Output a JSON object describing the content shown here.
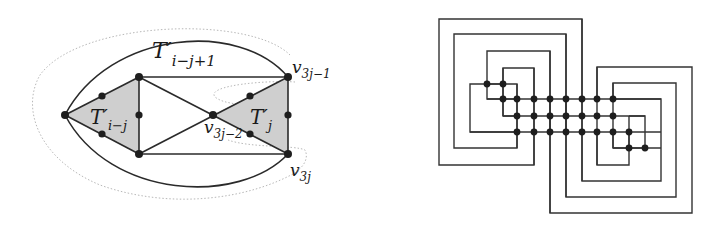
{
  "figure": {
    "left_panel": {
      "title": "triangulated graph construction",
      "labels": {
        "outer_region": "T′",
        "outer_region_sub": "i−j+1",
        "left_triangle": "T′",
        "left_triangle_sub": "i−j",
        "right_triangle": "T′",
        "right_triangle_sub": "j",
        "v_top_right": "v",
        "v_top_right_sub": "3j−1",
        "v_middle": "v",
        "v_middle_sub": "3j−2",
        "v_bottom_right": "v",
        "v_bottom_right_sub": "3j"
      },
      "colors": {
        "edge": "#2a2a2a",
        "shade": "#cfcfcf",
        "dotted": "#b8b8b8",
        "node": "#1e1e1e"
      }
    },
    "right_panel": {
      "title": "nested rectilinear grid drawing",
      "columns": 11,
      "rows": 5,
      "colors": {
        "wire": "#333333",
        "node": "#1e1e1e"
      }
    }
  }
}
